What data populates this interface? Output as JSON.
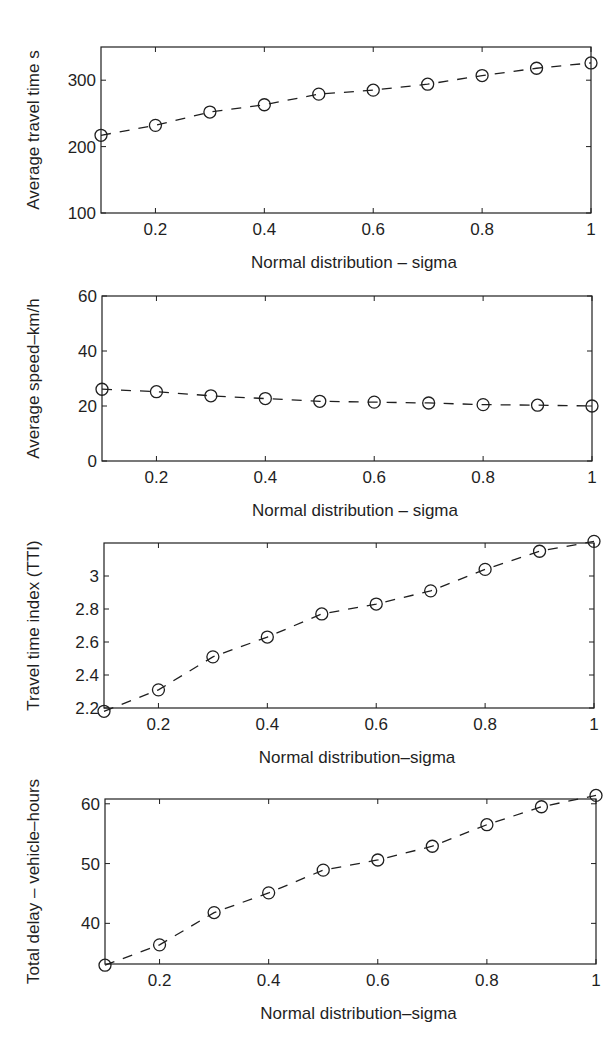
{
  "figure": {
    "background": "#ffffff",
    "ink_color": "#1f1f1f"
  },
  "chart_data": [
    {
      "type": "line",
      "title": "",
      "xlabel": "Normal distribution – sigma",
      "ylabel": "Average travel time s",
      "x": [
        0.1,
        0.2,
        0.3,
        0.4,
        0.5,
        0.6,
        0.7,
        0.8,
        0.9,
        1.0
      ],
      "series": [
        {
          "name": "Average travel time",
          "values": [
            217,
            232,
            252,
            263,
            279,
            285,
            294,
            307,
            318,
            326
          ],
          "line_style": "dashed",
          "marker": "circle"
        }
      ],
      "xlim": [
        0.1,
        1.0
      ],
      "ylim": [
        100,
        350
      ],
      "xticks": [
        0.2,
        0.4,
        0.6,
        0.8,
        1
      ],
      "xtick_labels": [
        "0.2",
        "0.4",
        "0.6",
        "0.8",
        "1"
      ],
      "yticks": [
        100,
        200,
        300
      ],
      "ytick_labels": [
        "100",
        "200",
        "300"
      ],
      "grid": false,
      "legend": null,
      "box": {
        "left": 101,
        "top": 47,
        "right": 591,
        "bottom": 213
      }
    },
    {
      "type": "line",
      "title": "",
      "xlabel": "Normal distribution – sigma",
      "ylabel": "Average speed–km/h",
      "x": [
        0.1,
        0.2,
        0.3,
        0.4,
        0.5,
        0.6,
        0.7,
        0.8,
        0.9,
        1.0
      ],
      "series": [
        {
          "name": "Average speed",
          "values": [
            26.1,
            25.2,
            23.7,
            22.7,
            21.7,
            21.4,
            21.1,
            20.5,
            20.3,
            20.0
          ],
          "line_style": "dashed",
          "marker": "circle"
        }
      ],
      "xlim": [
        0.1,
        1.0
      ],
      "ylim": [
        0,
        60
      ],
      "xticks": [
        0.2,
        0.4,
        0.6,
        0.8,
        1
      ],
      "xtick_labels": [
        "0.2",
        "0.4",
        "0.6",
        "0.8",
        "1"
      ],
      "yticks": [
        0,
        20,
        40,
        60
      ],
      "ytick_labels": [
        "0",
        "20",
        "40",
        "60"
      ],
      "grid": false,
      "legend": null,
      "box": {
        "left": 102,
        "top": 296,
        "right": 592,
        "bottom": 461
      }
    },
    {
      "type": "line",
      "title": "",
      "xlabel": "Normal distribution–sigma",
      "ylabel": "Travel time index (TTI)",
      "x": [
        0.1,
        0.2,
        0.3,
        0.4,
        0.5,
        0.6,
        0.7,
        0.8,
        0.9,
        1.0
      ],
      "series": [
        {
          "name": "TTI",
          "values": [
            2.18,
            2.31,
            2.51,
            2.63,
            2.77,
            2.83,
            2.91,
            3.04,
            3.15,
            3.21
          ],
          "line_style": "dashed",
          "marker": "circle"
        }
      ],
      "xlim": [
        0.1,
        1.0
      ],
      "ylim": [
        2.2,
        3.2
      ],
      "xticks": [
        0.2,
        0.4,
        0.6,
        0.8,
        1
      ],
      "xtick_labels": [
        "0.2",
        "0.4",
        "0.6",
        "0.8",
        "1"
      ],
      "yticks": [
        2.2,
        2.4,
        2.6,
        2.8,
        3.0
      ],
      "ytick_labels": [
        "2.2",
        "2.4",
        "2.6",
        "2.8",
        "3"
      ],
      "grid": false,
      "legend": null,
      "box": {
        "left": 104,
        "top": 543,
        "right": 594,
        "bottom": 708
      }
    },
    {
      "type": "line",
      "title": "",
      "xlabel": "Normal distribution–sigma",
      "ylabel": "Total delay – vehicle–hours",
      "x": [
        0.1,
        0.2,
        0.3,
        0.4,
        0.5,
        0.6,
        0.7,
        0.8,
        0.9,
        1.0
      ],
      "series": [
        {
          "name": "Total delay",
          "values": [
            33.0,
            36.4,
            41.8,
            45.1,
            48.9,
            50.6,
            52.9,
            56.5,
            59.5,
            61.4
          ],
          "line_style": "dashed",
          "marker": "circle"
        }
      ],
      "xlim": [
        0.1,
        1.0
      ],
      "ylim": [
        33.2,
        60.8
      ],
      "xticks": [
        0.2,
        0.4,
        0.6,
        0.8,
        1
      ],
      "xtick_labels": [
        "0.2",
        "0.4",
        "0.6",
        "0.8",
        "1"
      ],
      "yticks": [
        40,
        50,
        60
      ],
      "ytick_labels": [
        "40",
        "50",
        "60"
      ],
      "grid": false,
      "legend": null,
      "box": {
        "left": 105,
        "top": 799,
        "right": 596,
        "bottom": 964
      }
    }
  ]
}
